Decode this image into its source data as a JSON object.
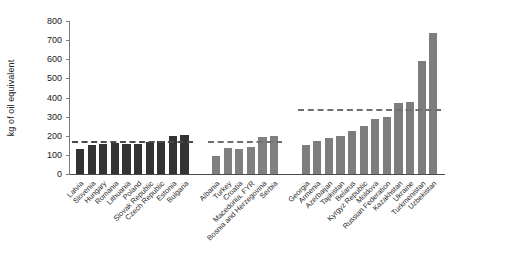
{
  "chart_data": {
    "type": "bar",
    "title": "",
    "xlabel": "",
    "ylabel": "kg of oil equivalent",
    "ylim": [
      0,
      800
    ],
    "yticks": [
      0,
      100,
      200,
      300,
      400,
      500,
      600,
      700,
      800
    ],
    "grid": false,
    "legend": "none",
    "groups": [
      {
        "name": "group-1",
        "color": "#333333",
        "reference_line_value": 170,
        "categories": [
          "Latvia",
          "Slovenia",
          "Hungary",
          "Romania",
          "Lithuania",
          "Poland",
          "Slovak Republic",
          "Czech Republic",
          "Estonia",
          "Bulgaria"
        ],
        "values": [
          130,
          150,
          155,
          160,
          158,
          157,
          168,
          172,
          200,
          205
        ]
      },
      {
        "name": "group-2",
        "color": "#808080",
        "reference_line_value": 172,
        "categories": [
          "Albania",
          "Turkey",
          "Croatia",
          "Macedonia, FYR",
          "Bosnia and Herzegovina",
          "Serbia"
        ],
        "values": [
          92,
          135,
          130,
          140,
          195,
          200
        ]
      },
      {
        "name": "group-3",
        "color": "#7d7d7d",
        "reference_line_value": 340,
        "categories": [
          "Georgia",
          "Armenia",
          "Azerbaijan",
          "Tajikistan",
          "Belarus",
          "Kyrgyz Republic",
          "Moldova",
          "Russian Federation",
          "Kazakhstan",
          "Ukraine",
          "Turkmenistan",
          "Uzbekistan"
        ],
        "values": [
          150,
          175,
          190,
          200,
          225,
          250,
          290,
          300,
          370,
          375,
          590,
          735
        ]
      }
    ]
  }
}
